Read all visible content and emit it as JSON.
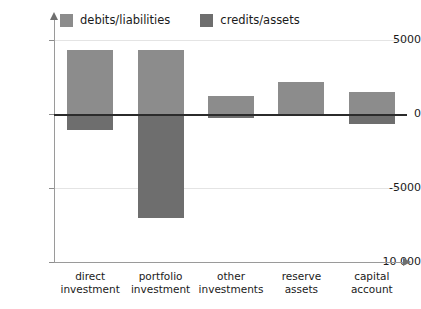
{
  "chart_data": {
    "type": "bar",
    "title": "",
    "xlabel": "",
    "ylabel": "",
    "categories": [
      "direct investment",
      "portfolio investment",
      "other investments",
      "reserve assets",
      "capital account"
    ],
    "series": [
      {
        "name": "credits/assets",
        "values": [
          4300,
          4300,
          1200,
          2150,
          1500
        ]
      },
      {
        "name": "debits/liabilities",
        "values": [
          -1100,
          -7000,
          -300,
          0,
          -700
        ]
      }
    ],
    "ylim": [
      -10000,
      5000
    ],
    "yticks": [
      5000,
      0,
      -5000,
      -10000
    ],
    "ytick_labels": [
      "5000",
      "0",
      "-5000",
      "-10 000"
    ],
    "grid": true,
    "legend_position": "top-left",
    "colors": {
      "credits_assets": "#8c8c8c",
      "debits_liabilities": "#6e6e6e",
      "axis": "#9a9a9a",
      "zero_line": "#2b2b2b",
      "gridline": "#e4e4e4",
      "text": "#1a1a1a"
    }
  },
  "legend": {
    "items": [
      {
        "label": "debits/liabilities",
        "color": "#8c8c8c"
      },
      {
        "label": "credits/assets",
        "color": "#6e6e6e"
      }
    ]
  },
  "axis": {
    "y_ticks": [
      {
        "label": "5000",
        "value": 5000
      },
      {
        "label": "0",
        "value": 0
      },
      {
        "label": "-5000",
        "value": -5000
      },
      {
        "label": "-10 000",
        "value": -10000
      }
    ]
  },
  "categories": [
    {
      "line1": "direct",
      "line2": "investment"
    },
    {
      "line1": "portfolio",
      "line2": "investment"
    },
    {
      "line1": "other",
      "line2": "investments"
    },
    {
      "line1": "reserve",
      "line2": "assets"
    },
    {
      "line1": "capital",
      "line2": "account"
    }
  ]
}
